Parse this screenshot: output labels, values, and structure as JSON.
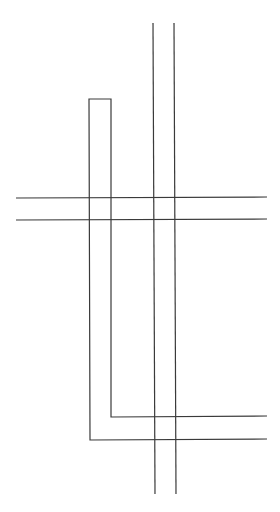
{
  "diagram": {
    "stroke_color": "#3a3a3a",
    "stroke_width": 1.2,
    "background": "#ffffff",
    "horizontal_lines": [
      {
        "id": "h-top",
        "x1": 16,
        "y1": 198,
        "x2": 267,
        "y2": 197
      },
      {
        "id": "h-bottom",
        "x1": 16,
        "y1": 220,
        "x2": 267,
        "y2": 219
      }
    ],
    "vertical_lines": [
      {
        "id": "v-left",
        "x1": 153,
        "y1": 23,
        "x2": 155,
        "y2": 494
      },
      {
        "id": "v-right",
        "x1": 174,
        "y1": 23,
        "x2": 176,
        "y2": 494
      }
    ],
    "u_path": {
      "id": "u-shape",
      "points": "267,439 90,440 89,99 111,99 111,417 267,416"
    }
  }
}
